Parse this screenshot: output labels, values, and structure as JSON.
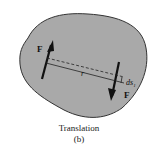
{
  "figure": {
    "caption_title": "Translation",
    "caption_sub": "(b)",
    "force_label_left": "F",
    "force_label_right": "F",
    "distance_label": "r",
    "displacement_label": "ds",
    "displacement_subscript": "1",
    "colors": {
      "body_fill": "#a9a9a9",
      "body_stroke": "#333333",
      "arrow": "#111111"
    }
  }
}
